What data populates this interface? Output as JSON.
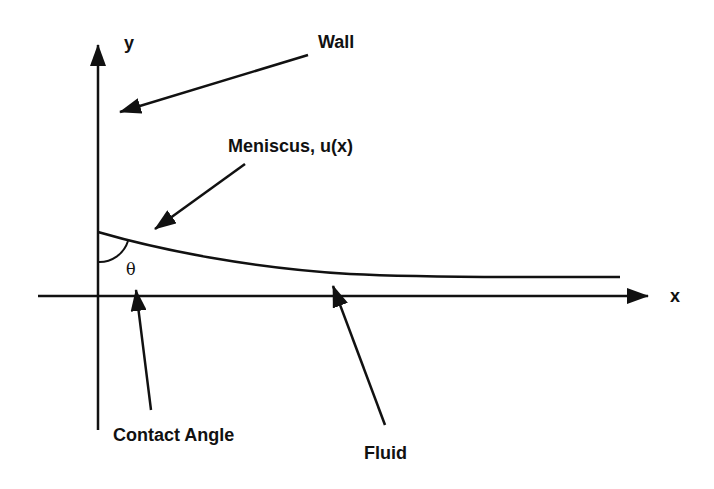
{
  "diagram": {
    "labels": {
      "y_axis": "y",
      "x_axis": "x",
      "wall": "Wall",
      "meniscus": "Meniscus, u(x)",
      "theta": "θ",
      "contact_angle": "Contact Angle",
      "fluid": "Fluid"
    },
    "colors": {
      "ink": "#111111",
      "background": "#ffffff"
    }
  }
}
